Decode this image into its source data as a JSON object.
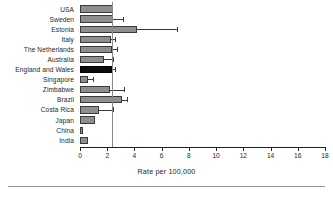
{
  "chart_data": {
    "type": "bar",
    "orientation": "horizontal",
    "title": "",
    "xlabel": "Rate per 100,000",
    "ylabel": "",
    "xlim": [
      0,
      18
    ],
    "xticks": [
      0,
      2,
      4,
      6,
      8,
      10,
      12,
      14,
      16,
      18
    ],
    "xtick_labels": [
      "0",
      "2",
      "4",
      "6",
      "8",
      "10",
      "12",
      "14",
      "16",
      "18"
    ],
    "grid": false,
    "legend": false,
    "reference_line": 2.35,
    "highlight_category": "England and Wales",
    "categories": [
      "USA",
      "Sweden",
      "Estonia",
      "Italy",
      "The Netherlands",
      "Australia",
      "England and Wales",
      "Singapore",
      "Zimbabwe",
      "Brazil",
      "Costa Rica",
      "Japan",
      "China",
      "India"
    ],
    "values": [
      2.4,
      2.4,
      4.2,
      2.3,
      2.35,
      1.75,
      2.35,
      0.6,
      2.2,
      3.1,
      1.4,
      1.1,
      0.25,
      0.6
    ],
    "error_high": [
      2.4,
      3.2,
      7.2,
      2.6,
      2.8,
      2.5,
      2.6,
      1.0,
      3.3,
      3.5,
      2.5,
      1.1,
      0.25,
      0.6
    ],
    "error_low": [
      2.4,
      2.4,
      4.2,
      2.3,
      2.35,
      1.75,
      2.35,
      0.6,
      2.2,
      3.1,
      1.4,
      1.1,
      0.25,
      0.6
    ],
    "colors": {
      "bar_fill": "#8e8e8e",
      "bar_edge": "#3a3a3a",
      "highlight_fill": "#0d0d0d",
      "reference_line": "#8a8a8a",
      "axis": "#231f20",
      "text": "#231f20"
    }
  }
}
